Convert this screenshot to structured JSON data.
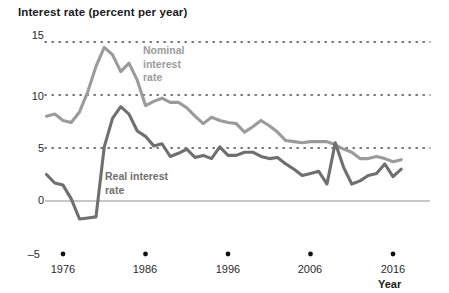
{
  "chart_data": {
    "type": "line",
    "title": "Interest rate (percent per year)",
    "xlabel": "Year",
    "ylabel": "Interest rate (percent per year)",
    "xlim": [
      1974,
      2017
    ],
    "ylim": [
      -5,
      15
    ],
    "yticks": [
      -5,
      0,
      5,
      10,
      15
    ],
    "ytick_labels": [
      "–5",
      "0",
      "5",
      "10",
      "15"
    ],
    "xticks": [
      1976,
      1986,
      1996,
      2006,
      2016
    ],
    "xtick_labels": [
      "1976",
      "1986",
      "1996",
      "2006",
      "2016"
    ],
    "grid": "dotted horizontal gridlines at 5, 10 and 15; solid zero line at 0",
    "legend_position": "inline annotations next to curves",
    "series": [
      {
        "name": "Nominal interest rate",
        "color": "#9b9b9b",
        "x": [
          1974,
          1975,
          1976,
          1977,
          1978,
          1979,
          1980,
          1981,
          1982,
          1983,
          1984,
          1985,
          1986,
          1987,
          1988,
          1989,
          1990,
          1991,
          1992,
          1993,
          1994,
          1995,
          1996,
          1997,
          1998,
          1999,
          2000,
          2001,
          2002,
          2003,
          2004,
          2005,
          2006,
          2007,
          2008,
          2009,
          2010,
          2011,
          2012,
          2013,
          2014,
          2015,
          2016,
          2017
        ],
        "values": [
          8.0,
          8.2,
          7.6,
          7.4,
          8.4,
          10.3,
          12.7,
          14.5,
          13.8,
          12.2,
          13.0,
          11.4,
          9.0,
          9.4,
          9.7,
          9.3,
          9.3,
          8.8,
          8.0,
          7.3,
          7.9,
          7.6,
          7.4,
          7.3,
          6.5,
          7.0,
          7.6,
          7.1,
          6.5,
          5.7,
          5.6,
          5.5,
          5.6,
          5.6,
          5.6,
          5.3,
          4.9,
          4.6,
          4.0,
          4.0,
          4.2,
          4.0,
          3.7,
          3.9
        ],
        "units": "percent per year"
      },
      {
        "name": "Real interest rate",
        "color": "#6f6f6f",
        "x": [
          1974,
          1975,
          1976,
          1977,
          1978,
          1979,
          1980,
          1981,
          1982,
          1983,
          1984,
          1985,
          1986,
          1987,
          1988,
          1989,
          1990,
          1991,
          1992,
          1993,
          1994,
          1995,
          1996,
          1997,
          1998,
          1999,
          2000,
          2001,
          2002,
          2003,
          2004,
          2005,
          2006,
          2007,
          2008,
          2009,
          2010,
          2011,
          2012,
          2013,
          2014,
          2015,
          2016,
          2017
        ],
        "values": [
          2.5,
          1.7,
          1.5,
          0.2,
          -1.7,
          -1.6,
          -1.5,
          5.1,
          7.8,
          8.9,
          8.2,
          6.6,
          6.1,
          5.2,
          5.4,
          4.2,
          4.5,
          4.9,
          4.1,
          4.3,
          4.0,
          5.1,
          4.3,
          4.3,
          4.6,
          4.6,
          4.2,
          4.0,
          4.1,
          3.5,
          3.0,
          2.4,
          2.6,
          2.8,
          1.6,
          5.5,
          3.2,
          1.6,
          1.9,
          2.4,
          2.6,
          3.5,
          2.3,
          3.0
        ],
        "units": "percent per year"
      }
    ],
    "annotations": [
      {
        "id": "nominal",
        "text_lines": [
          "Nominal",
          "interest",
          "rate"
        ],
        "series": "Nominal interest rate"
      },
      {
        "id": "real",
        "text_lines": [
          "Real interest",
          "rate"
        ],
        "series": "Real interest rate"
      }
    ],
    "colors": {
      "nominal": "#9b9b9b",
      "real": "#6f6f6f",
      "zero_line": "#b5b5b5",
      "gridline": "#4a4a4a",
      "text": "#2b2b2b"
    }
  },
  "axis": {
    "title": "Interest rate (percent per year)",
    "x_title": "Year",
    "y_labels": [
      "15",
      "10",
      "5",
      "0",
      "–5"
    ],
    "x_labels": [
      "1976",
      "1986",
      "1996",
      "2006",
      "2016"
    ]
  },
  "annotations": {
    "nominal_line1": "Nominal",
    "nominal_line2": "interest",
    "nominal_line3": "rate",
    "real_line1": "Real interest",
    "real_line2": "rate"
  }
}
